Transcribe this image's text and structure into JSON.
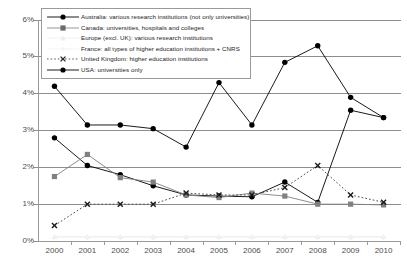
{
  "chart_data": {
    "type": "line",
    "title": "",
    "xlabel": "",
    "ylabel": "",
    "x": [
      2000,
      2001,
      2002,
      2003,
      2004,
      2005,
      2006,
      2007,
      2008,
      2009,
      2010
    ],
    "xticklabels": [
      "2000",
      "2001",
      "2002",
      "2003",
      "2004",
      "2005",
      "2006",
      "2007",
      "2008",
      "2009",
      "2010"
    ],
    "yticklabels": [
      "0%",
      "1%",
      "2%",
      "3%",
      "4%",
      "5%",
      "6%"
    ],
    "ytickvalues": [
      0,
      1,
      2,
      3,
      4,
      5,
      6
    ],
    "ylim": [
      0,
      6
    ],
    "grid": true,
    "legend_position": "top-left-inside",
    "series": [
      {
        "name": "Australia: various research institutions (not only universities)",
        "short": "Australia",
        "color": "#000000",
        "marker": "circle",
        "linestyle": "solid",
        "values": [
          2.8,
          2.05,
          1.8,
          1.5,
          1.25,
          1.22,
          1.2,
          1.6,
          1.05,
          3.55,
          3.35
        ]
      },
      {
        "name": "Canada: universities, hospitals and colleges",
        "short": "Canada",
        "color": "#808080",
        "marker": "square",
        "linestyle": "solid",
        "values": [
          1.75,
          2.35,
          1.72,
          1.6,
          1.25,
          1.18,
          1.3,
          1.22,
          1.0,
          1.0,
          0.98
        ]
      },
      {
        "name": "Europe (excl. UK): various research institutions",
        "short": "Europe (excl. UK)",
        "color": "#eeeeee",
        "marker": "triangle",
        "linestyle": "solid",
        "values": [
          0.12,
          0.12,
          0.12,
          0.12,
          0.12,
          0.12,
          0.12,
          0.12,
          0.12,
          0.12,
          0.12
        ]
      },
      {
        "name": "France: all types of higher education institutions + CNRS",
        "short": "France",
        "color": "#f2f2f2",
        "marker": "cross",
        "linestyle": "solid",
        "values": [
          0.1,
          0.1,
          0.1,
          0.1,
          0.1,
          0.1,
          0.1,
          0.1,
          0.1,
          0.1,
          0.1
        ]
      },
      {
        "name": "United Kingdom: higher education institutions",
        "short": "United Kingdom",
        "color": "#4d4d4d",
        "marker": "x",
        "linestyle": "dotted",
        "values": [
          0.42,
          1.0,
          1.0,
          1.0,
          1.3,
          1.25,
          1.25,
          1.45,
          2.05,
          1.25,
          1.05
        ]
      },
      {
        "name": "USA: universities only",
        "short": "USA",
        "color": "#000000",
        "marker": "circle",
        "linestyle": "solid",
        "values": [
          4.2,
          3.15,
          3.15,
          3.05,
          2.55,
          4.3,
          3.15,
          4.85,
          5.3,
          3.9,
          3.35
        ]
      }
    ]
  },
  "legend": {
    "items": [
      "Australia: various research institutions (not only universities)",
      "Canada: universities, hospitals and colleges",
      "Europe (excl. UK): various research institutions",
      "France: all types of higher education institutions + CNRS",
      "United Kingdom: higher education institutions",
      "USA: universities only"
    ]
  },
  "axes": {
    "y": [
      "6%",
      "5%",
      "4%",
      "3%",
      "2%",
      "1%",
      "0%"
    ],
    "x": [
      "2000",
      "2001",
      "2002",
      "2003",
      "2004",
      "2005",
      "2006",
      "2007",
      "2008",
      "2009",
      "2010"
    ]
  }
}
